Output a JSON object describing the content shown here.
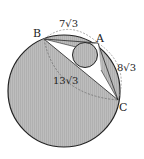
{
  "diagram": {
    "points": {
      "A": {
        "label": "A"
      },
      "B": {
        "label": "B"
      },
      "C": {
        "label": "C"
      }
    },
    "lengths": {
      "AB": "7√3",
      "AC": "8√3",
      "BC": "13√3"
    },
    "colors": {
      "shade": "#b8b8b8",
      "stroke": "#222222",
      "dashed": "#777777",
      "background": "#ffffff"
    }
  }
}
